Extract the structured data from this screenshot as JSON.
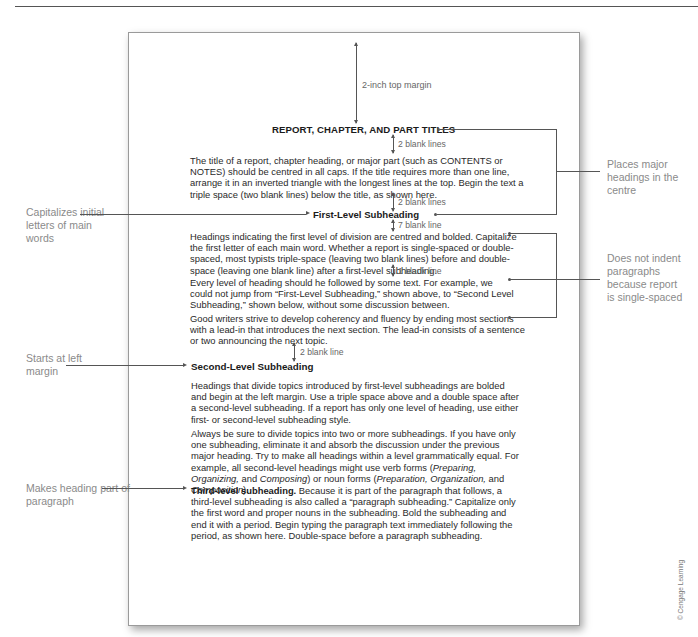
{
  "document": {
    "top_margin_label": "2-inch top margin",
    "title": "REPORT, CHAPTER, AND PART TITLES",
    "spacing_labels": {
      "after_title": "2 blank lines",
      "before_first_level": "2 blank lines",
      "after_first_level": "7 blank line",
      "between_paragraphs": "1 blank line",
      "before_second_level": "2 blank line"
    },
    "paragraph_title": "The title of a report, chapter heading, or major part (such as CONTENTS or NOTES) should be centred in all caps. If the title requires more than one line, arrange it in an inverted triangle with the longest lines at the top. Begin the text a triple space (two blank lines) below the title, as shown here.",
    "first_level_heading": "First-Level Subheading",
    "paragraph_first_level_1": "Headings indicating the first level of division are centred and bolded. Capitalize the first letter of each main word. Whether a report is single-spaced or double-spaced, most typists triple-space (leaving two blank lines) before and double-space (leaving one blank line) after a first-level subheading.",
    "paragraph_first_level_2": "Every level of heading should he followed by some text. For example, we could not jump from “First-Level Subheading,” shown above, to “Second Level Subheading,” shown below, without some discussion between.",
    "paragraph_first_level_3": "Good writers strive to develop coherency and fluency by ending most sections with a lead-in that introduces the next section. The lead-in consists of a sentence or two announcing the next topic.",
    "second_level_heading": "Second-Level Subheading",
    "paragraph_second_level_1": "Headings that divide topics introduced by first-level subheadings are bolded and begin at the left margin. Use a triple space above and a double space after a second-level subheading. If a report has only one level of heading, use either first- or second-level subheading style.",
    "paragraph_second_level_2": {
      "part1": "Always be sure to divide topics into two or more subheadings. If you have only one subheading, eliminate it and absorb the discussion under the previous major heading. Try to make all headings within a level grammatically equal. For example, all second-level headings might use verb forms (",
      "verb_forms": "Preparing, Organizing,",
      "part2": " and ",
      "verb_last": "Composing",
      "part3": ") or noun forms (",
      "noun_forms": "Preparation, Organization,",
      "part4": " and ",
      "noun_last": "Composition",
      "part5": ")."
    },
    "third_level_heading": "Third-level subheading.",
    "paragraph_third_level": " Because it is part of the paragraph that follows, a third-level subheading is also called a “paragraph subheading.” Capitalize only the first word and proper nouns in the subheading. Bold the subheading and end it with a period. Begin typing the paragraph text immediately following the period, as shown here. Double-space before a paragraph subheading."
  },
  "annotations": {
    "left": [
      "Capitalizes initial letters of main words",
      "Starts at left margin",
      "Makes heading part of paragraph"
    ],
    "right": [
      "Places major headings in the centre",
      "Does not indent paragraphs because report is single-spaced"
    ]
  },
  "copyright": "© Cengage Learning"
}
